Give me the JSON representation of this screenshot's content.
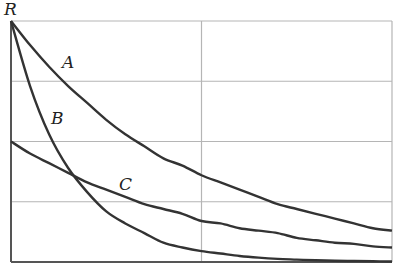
{
  "chart_data": {
    "type": "line",
    "title": "",
    "xlabel": "",
    "ylabel": "R",
    "xlim": [
      0,
      1
    ],
    "ylim": [
      0,
      1
    ],
    "grid": true,
    "grid_x": [
      0.5
    ],
    "grid_y": [
      0.25,
      0.5,
      0.75,
      1.0
    ],
    "legend": "inline labels",
    "x": [
      0,
      0.05,
      0.1,
      0.15,
      0.2,
      0.25,
      0.3,
      0.35,
      0.4,
      0.45,
      0.5,
      0.55,
      0.6,
      0.65,
      0.7,
      0.75,
      0.8,
      0.85,
      0.9,
      0.95,
      1.0
    ],
    "series": [
      {
        "name": "A",
        "values": [
          1.0,
          0.9,
          0.81,
          0.73,
          0.66,
          0.59,
          0.53,
          0.48,
          0.43,
          0.4,
          0.36,
          0.33,
          0.3,
          0.27,
          0.24,
          0.22,
          0.2,
          0.18,
          0.16,
          0.14,
          0.13
        ]
      },
      {
        "name": "B",
        "values": [
          1.0,
          0.73,
          0.53,
          0.39,
          0.29,
          0.21,
          0.16,
          0.12,
          0.08,
          0.06,
          0.045,
          0.035,
          0.025,
          0.018,
          0.013,
          0.01,
          0.007,
          0.005,
          0.004,
          0.003,
          0.002
        ]
      },
      {
        "name": "C",
        "values": [
          0.5,
          0.45,
          0.41,
          0.37,
          0.33,
          0.3,
          0.27,
          0.24,
          0.22,
          0.2,
          0.17,
          0.16,
          0.14,
          0.13,
          0.12,
          0.1,
          0.09,
          0.08,
          0.075,
          0.065,
          0.06
        ]
      }
    ],
    "annotations": [
      {
        "text": "A",
        "x": 0.15,
        "y": 0.82
      },
      {
        "text": "B",
        "x": 0.12,
        "y": 0.59
      },
      {
        "text": "C",
        "x": 0.29,
        "y": 0.32
      }
    ]
  },
  "labels": {
    "y_axis": "R",
    "curve_a": "A",
    "curve_b": "B",
    "curve_c": "C"
  }
}
